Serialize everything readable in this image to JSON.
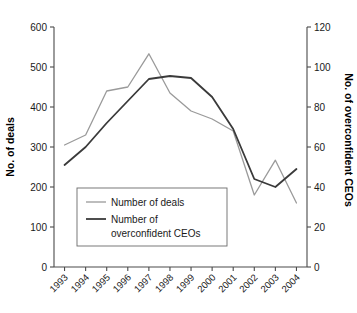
{
  "chart_data": {
    "type": "line",
    "title": "",
    "xlabel": "",
    "categories": [
      "1993",
      "1994",
      "1995",
      "1996",
      "1997",
      "1998",
      "1999",
      "2000",
      "2001",
      "2002",
      "2003",
      "2004"
    ],
    "grid": false,
    "legend_position": "inside-lower-left",
    "axes": {
      "left": {
        "label": "No. of deals",
        "ylim": [
          0,
          600
        ],
        "ticks": [
          0,
          100,
          200,
          300,
          400,
          500,
          600
        ],
        "tick_labels": [
          "0",
          "100",
          "200",
          "300",
          "400",
          "500",
          "600"
        ]
      },
      "right": {
        "label": "No. of overconfident CEOs",
        "ylim": [
          0,
          120
        ],
        "ticks": [
          0,
          20,
          40,
          60,
          80,
          100,
          120
        ],
        "tick_labels": [
          "0",
          "20",
          "40",
          "60",
          "80",
          "100",
          "120"
        ]
      }
    },
    "series": [
      {
        "name": "Number of deals",
        "axis": "left",
        "color": "#9a9a9a",
        "values": [
          305,
          330,
          440,
          450,
          533,
          435,
          390,
          370,
          340,
          180,
          267,
          160
        ]
      },
      {
        "name": "Number of overconfident CEOs",
        "axis": "right",
        "color": "#3a3a3a",
        "values": [
          51,
          60,
          72,
          83,
          94,
          95.5,
          94.5,
          85,
          69,
          44,
          40,
          49
        ]
      }
    ]
  },
  "legend": {
    "entries": [
      {
        "label": "Number of deals",
        "label_line2": ""
      },
      {
        "label": "Number of",
        "label_line2": "overconfident CEOs"
      }
    ]
  },
  "colors": {
    "deals_line": "#9a9a9a",
    "ceo_line": "#3a3a3a",
    "axis": "#4a4a4a",
    "text": "#1a1a1a",
    "background": "#ffffff"
  }
}
